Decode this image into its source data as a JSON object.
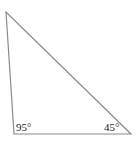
{
  "diagram": {
    "type": "triangle",
    "stroke_color": "#8a8a8a",
    "vertices": {
      "top": {
        "x": 6,
        "y": 12
      },
      "bottom_left": {
        "x": 14,
        "y": 134
      },
      "bottom_right": {
        "x": 131,
        "y": 134
      }
    },
    "angles": [
      {
        "vertex": "bottom_left",
        "label": "95°"
      },
      {
        "vertex": "bottom_right",
        "label": "45°"
      }
    ]
  }
}
